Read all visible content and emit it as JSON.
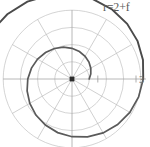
{
  "figure": {
    "title": "r=2+f",
    "tick_label_right": "3",
    "background_color": "#ffffff",
    "curve_color": "#4a4a4a",
    "grid_color": "#b9b9b9",
    "axis_color": "#a6a6a6",
    "text_color": "#5a5a5a",
    "origin_marker_color": "#2b2b2b"
  },
  "chart_data": {
    "type": "line",
    "plot_kind": "polar",
    "title": "r=2+f",
    "equation": "r=2+f",
    "xlabel": "",
    "ylabel": "",
    "grid": true,
    "legend": "none",
    "theta_range_deg": [
      0,
      720
    ],
    "r_range": [
      2,
      14.566
    ],
    "radial_tick_labels": [
      "3"
    ],
    "radial_ticks": [
      3
    ],
    "angular_spokes_deg": [
      0,
      30,
      60,
      90,
      120,
      150,
      180,
      210,
      240,
      270,
      300,
      330
    ],
    "grid_circles_r": [
      2.0,
      4.0,
      6.0,
      8.0
    ],
    "series": [
      {
        "name": "r=2+f",
        "theta_deg": [
          0,
          15,
          30,
          45,
          60,
          75,
          90,
          105,
          120,
          135,
          150,
          165,
          180,
          195,
          210,
          225,
          240,
          255,
          270,
          285,
          300,
          315,
          330,
          345,
          360,
          375,
          390,
          405,
          420,
          435,
          450,
          465,
          480,
          495,
          510,
          525,
          540,
          555,
          570,
          585,
          600,
          615,
          630,
          645,
          660,
          675,
          690,
          705,
          720
        ],
        "r": [
          2.0,
          2.262,
          2.524,
          2.785,
          3.047,
          3.309,
          3.571,
          3.833,
          4.094,
          4.356,
          4.618,
          4.88,
          5.142,
          5.403,
          5.665,
          5.927,
          6.189,
          6.451,
          6.712,
          6.974,
          7.236,
          7.498,
          7.76,
          8.021,
          8.283,
          8.545,
          8.807,
          9.069,
          9.33,
          9.592,
          9.854,
          10.116,
          10.378,
          10.639,
          10.901,
          11.163,
          11.425,
          11.687,
          11.948,
          12.21,
          12.472,
          12.734,
          12.996,
          13.257,
          13.519,
          13.781,
          14.043,
          14.305,
          14.566
        ]
      }
    ]
  },
  "geometry": {
    "center_x": 72,
    "center_y": 79,
    "pixels_per_unit": 8.6
  }
}
